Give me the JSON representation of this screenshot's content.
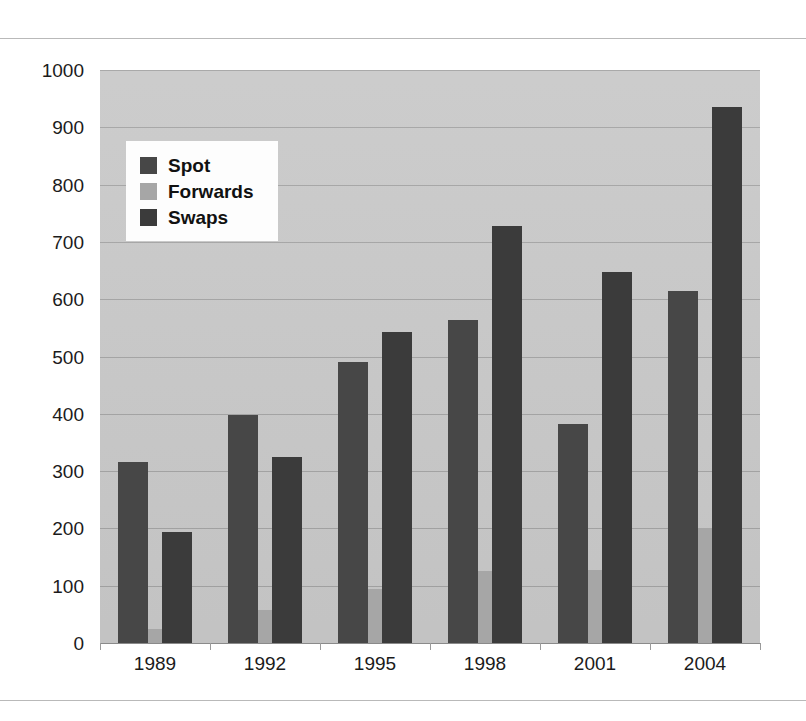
{
  "chart_data": {
    "type": "bar",
    "title": "",
    "subtitle": "",
    "xlabel": "",
    "ylabel": "",
    "categories": [
      "1989",
      "1992",
      "1995",
      "1998",
      "2001",
      "2004"
    ],
    "series": [
      {
        "name": "Spot",
        "color": "#474747",
        "values": [
          316,
          398,
          490,
          563,
          382,
          615
        ]
      },
      {
        "name": "Forwards",
        "color": "#a6a6a6",
        "values": [
          25,
          58,
          95,
          125,
          128,
          200
        ]
      },
      {
        "name": "Swaps",
        "color": "#3b3b3b",
        "values": [
          193,
          325,
          543,
          728,
          648,
          935
        ]
      }
    ],
    "ylim": [
      0,
      1000
    ],
    "y_ticks": [
      "0",
      "100",
      "200",
      "300",
      "400",
      "500",
      "600",
      "700",
      "800",
      "900",
      "1000"
    ],
    "grid": true,
    "legend_position": "top-left",
    "plot_background": "#c9c9c9",
    "annotations": []
  },
  "legend": {
    "items": [
      {
        "label": "Spot",
        "swatch": "spot-swatch"
      },
      {
        "label": "Forwards",
        "swatch": "forwards-swatch"
      },
      {
        "label": "Swaps",
        "swatch": "swaps-swatch"
      }
    ]
  }
}
